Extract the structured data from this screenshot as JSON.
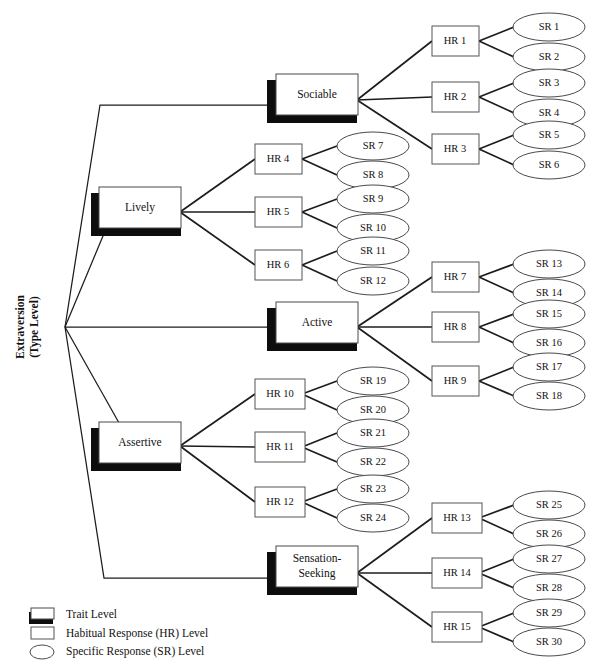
{
  "diagram": {
    "title_label": "Extraversion\n(Type Level)",
    "type_level": {
      "line1": "Extraversion",
      "line2": "(Type Level)"
    },
    "traits": [
      {
        "id": "sociable",
        "label": "Sociable",
        "label_line1": "Sociable",
        "label_line2": "",
        "hrs": [
          {
            "label": "HR 1",
            "srs": [
              "SR 1",
              "SR 2"
            ]
          },
          {
            "label": "HR 2",
            "srs": [
              "SR 3",
              "SR 4"
            ]
          },
          {
            "label": "HR 3",
            "srs": [
              "SR 5",
              "SR 6"
            ]
          }
        ]
      },
      {
        "id": "lively",
        "label": "Lively",
        "label_line1": "Lively",
        "label_line2": "",
        "hrs": [
          {
            "label": "HR 4",
            "srs": [
              "SR 7",
              "SR 8"
            ]
          },
          {
            "label": "HR 5",
            "srs": [
              "SR 9",
              "SR 10"
            ]
          },
          {
            "label": "HR 6",
            "srs": [
              "SR 11",
              "SR 12"
            ]
          }
        ]
      },
      {
        "id": "active",
        "label": "Active",
        "label_line1": "Active",
        "label_line2": "",
        "hrs": [
          {
            "label": "HR 7",
            "srs": [
              "SR 13",
              "SR 14"
            ]
          },
          {
            "label": "HR 8",
            "srs": [
              "SR 15",
              "SR 16"
            ]
          },
          {
            "label": "HR 9",
            "srs": [
              "SR 17",
              "SR 18"
            ]
          }
        ]
      },
      {
        "id": "assertive",
        "label": "Assertive",
        "label_line1": "Assertive",
        "label_line2": "",
        "hrs": [
          {
            "label": "HR 10",
            "srs": [
              "SR 19",
              "SR 20"
            ]
          },
          {
            "label": "HR 11",
            "srs": [
              "SR 21",
              "SR 22"
            ]
          },
          {
            "label": "HR 12",
            "srs": [
              "SR 23",
              "SR 24"
            ]
          }
        ]
      },
      {
        "id": "sensation-seeking",
        "label": "Sensation-Seeking",
        "label_line1": "Sensation-",
        "label_line2": "Seeking",
        "hrs": [
          {
            "label": "HR 13",
            "srs": [
              "SR 25",
              "SR 26"
            ]
          },
          {
            "label": "HR 14",
            "srs": [
              "SR 27",
              "SR 28"
            ]
          },
          {
            "label": "HR 15",
            "srs": [
              "SR 29",
              "SR 30"
            ]
          }
        ]
      }
    ]
  },
  "legend": {
    "items": [
      {
        "shape": "shadow-rect-icon",
        "label": "Trait Level"
      },
      {
        "shape": "rect-icon",
        "label": "Habitual Response (HR) Level"
      },
      {
        "shape": "ellipse-icon",
        "label": "Specific Response (SR) Level"
      }
    ]
  },
  "colors": {
    "stroke": "#1c1c1c",
    "shadow": "#0d0d0d",
    "face": "#ffffff",
    "text": "#121212"
  }
}
